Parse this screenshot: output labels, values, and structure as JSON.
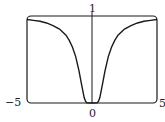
{
  "chart_data": {
    "type": "line",
    "title": "",
    "xlabel": "",
    "ylabel": "",
    "xlim": [
      -5,
      5
    ],
    "ylim": [
      0,
      1
    ],
    "grid": false,
    "legend": null,
    "tick_labels": {
      "x_left": "−5",
      "x_right": "5",
      "x_center": "0",
      "y_top": "1"
    },
    "series": [
      {
        "name": "f(x)",
        "x": [
          -5,
          -4.5,
          -4,
          -3.5,
          -3,
          -2.5,
          -2,
          -1.75,
          -1.5,
          -1.25,
          -1,
          -0.8,
          -0.6,
          -0.5,
          -0.4,
          0,
          0.4,
          0.5,
          0.6,
          0.8,
          1,
          1.25,
          1.5,
          1.75,
          2,
          2.5,
          3,
          3.5,
          4,
          4.5,
          5
        ],
        "y": [
          0.96,
          0.95,
          0.94,
          0.92,
          0.89,
          0.85,
          0.78,
          0.72,
          0.64,
          0.53,
          0.37,
          0.21,
          0.06,
          0.02,
          0.002,
          0,
          0.002,
          0.02,
          0.06,
          0.21,
          0.37,
          0.53,
          0.64,
          0.72,
          0.78,
          0.85,
          0.89,
          0.92,
          0.94,
          0.95,
          0.96
        ]
      }
    ],
    "colors": {
      "line": "#1a1a1a",
      "frame": "#1a1a1a",
      "background": "#ffffff"
    }
  }
}
